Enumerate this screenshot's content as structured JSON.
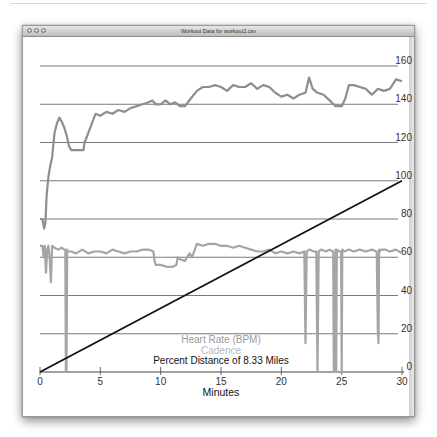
{
  "window": {
    "title": "Workout Data for workout2.csv",
    "buttons": [
      "close",
      "minimize",
      "zoom"
    ]
  },
  "chart_data": {
    "type": "line",
    "title": "Workout Data for workout2.csv",
    "xlabel": "Minutes",
    "ylabel": "",
    "xlim": [
      0,
      30
    ],
    "ylim": [
      0,
      160
    ],
    "x_ticks": [
      "0",
      "5",
      "10",
      "15",
      "20",
      "25",
      "30"
    ],
    "y_ticks": [
      "0",
      "20",
      "40",
      "60",
      "80",
      "100",
      "120",
      "140",
      "160"
    ],
    "grid": true,
    "legend": [
      "Heart Rate (BPM)",
      "Cadence",
      "Percent Distance of 8.33 Miles"
    ],
    "legend_position": "bottom-center",
    "series": [
      {
        "name": "Heart Rate (BPM)",
        "color": "#8e8e8e",
        "x": [
          0,
          0.2,
          0.35,
          0.45,
          0.55,
          0.7,
          0.85,
          1.0,
          1.2,
          1.4,
          1.6,
          1.8,
          2.0,
          2.2,
          2.4,
          2.6,
          2.7,
          3.6,
          3.7,
          4.0,
          4.3,
          4.6,
          5.0,
          5.5,
          6.0,
          6.5,
          7.0,
          7.5,
          8.0,
          8.5,
          9.0,
          9.3,
          9.6,
          10.0,
          10.4,
          10.8,
          11.2,
          11.6,
          12.0,
          12.5,
          13.0,
          13.5,
          14.0,
          14.5,
          15.0,
          15.5,
          16.0,
          16.5,
          17.0,
          17.5,
          18.0,
          18.5,
          19.0,
          19.5,
          20.0,
          20.5,
          21.0,
          21.5,
          22.0,
          22.3,
          22.6,
          23.0,
          23.5,
          24.0,
          24.5,
          25.0,
          25.3,
          25.6,
          26.0,
          26.5,
          27.0,
          27.5,
          28.0,
          28.5,
          29.0,
          29.5,
          30.0
        ],
        "values": [
          80,
          80,
          75,
          78,
          92,
          102,
          108,
          112,
          125,
          130,
          133,
          131,
          128,
          124,
          118,
          116,
          116,
          116,
          120,
          125,
          130,
          135,
          134,
          136,
          135,
          137,
          136,
          138,
          139,
          140,
          141,
          142,
          140,
          140,
          142,
          140,
          141,
          139,
          139,
          143,
          147,
          149,
          149,
          150,
          149,
          147,
          150,
          149,
          149,
          151,
          148,
          150,
          149,
          146,
          144,
          145,
          143,
          145,
          146,
          154,
          148,
          146,
          145,
          142,
          139,
          139,
          143,
          150,
          150,
          149,
          148,
          145,
          148,
          147,
          148,
          153,
          152
        ]
      },
      {
        "name": "Cadence",
        "color": "#a5a5a5",
        "x": [
          0,
          0.2,
          0.3,
          0.4,
          0.5,
          0.6,
          0.7,
          0.8,
          0.9,
          1.0,
          1.2,
          1.5,
          1.8,
          2.0,
          2.1,
          2.15,
          2.2,
          2.25,
          2.3,
          2.6,
          3.0,
          3.5,
          4.0,
          4.5,
          5.0,
          5.5,
          6.0,
          6.5,
          7.0,
          7.5,
          8.0,
          8.5,
          9.0,
          9.4,
          9.5,
          9.6,
          10.0,
          10.5,
          11.0,
          11.3,
          11.4,
          11.6,
          12.0,
          12.4,
          12.6,
          13.0,
          13.5,
          14.0,
          14.5,
          15.0,
          15.5,
          16.0,
          16.5,
          17.0,
          17.5,
          18.0,
          18.5,
          19.0,
          19.5,
          20.0,
          20.5,
          21.0,
          21.5,
          21.9,
          22.0,
          22.1,
          22.3,
          22.7,
          22.9,
          23.0,
          23.1,
          23.3,
          23.7,
          24.0,
          24.3,
          24.35,
          24.4,
          24.5,
          24.55,
          24.6,
          24.8,
          24.95,
          25.0,
          25.05,
          25.2,
          25.6,
          26.0,
          26.5,
          27.0,
          27.5,
          27.9,
          28.0,
          28.05,
          28.1,
          28.15,
          28.3,
          28.6,
          29.0,
          29.5,
          30.0
        ],
        "values": [
          66,
          66,
          60,
          66,
          52,
          64,
          66,
          59,
          47,
          66,
          65,
          64,
          65,
          64,
          64,
          0,
          0,
          64,
          63,
          63,
          62,
          64,
          62,
          63,
          63,
          62,
          64,
          63,
          62,
          63,
          63,
          64,
          64,
          63,
          58,
          56,
          56,
          55,
          55,
          56,
          60,
          59,
          58,
          62,
          60,
          67,
          66,
          67,
          67,
          66,
          66,
          65,
          66,
          65,
          64,
          63,
          63,
          64,
          62,
          63,
          62,
          63,
          62,
          63,
          15,
          63,
          64,
          63,
          63,
          0,
          63,
          64,
          63,
          64,
          63,
          0,
          0,
          64,
          0,
          64,
          63,
          63,
          0,
          64,
          63,
          64,
          63,
          64,
          63,
          64,
          63,
          20,
          15,
          64,
          63,
          64,
          64,
          63,
          64,
          62
        ]
      },
      {
        "name": "Percent Distance of 8.33 Miles",
        "color": "#111111",
        "x": [
          0,
          30
        ],
        "values": [
          0,
          100
        ]
      }
    ]
  }
}
